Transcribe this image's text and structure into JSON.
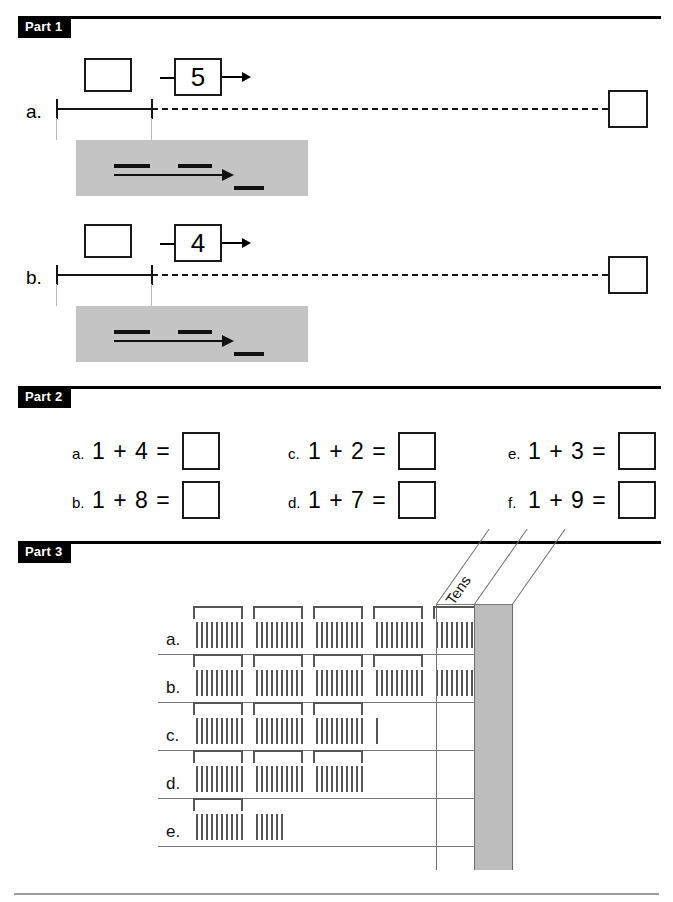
{
  "page": {
    "width": 673,
    "height": 902,
    "background": "#ffffff",
    "rule_color": "#000000",
    "gray_panel_color": "#c4c4c4",
    "tally_color": "#555555",
    "place_value_gray": "#bdbdbd"
  },
  "parts": [
    {
      "id": "part1",
      "label": "Part 1"
    },
    {
      "id": "part2",
      "label": "Part 2"
    },
    {
      "id": "part3",
      "label": "Part 3"
    }
  ],
  "part1": {
    "label": "Part 1",
    "rows": [
      {
        "label": "a.",
        "start_box_value": "",
        "operator_value": "5",
        "end_box_value": "",
        "number_line": {
          "ticks": 2,
          "solid": true,
          "dashed": true
        }
      },
      {
        "label": "b.",
        "start_box_value": "",
        "operator_value": "4",
        "end_box_value": "",
        "number_line": {
          "ticks": 2,
          "solid": true,
          "dashed": true
        }
      }
    ],
    "legend": {
      "blank_marks": 3,
      "arrow": "right-arrow"
    }
  },
  "part2": {
    "label": "Part 2",
    "problems": [
      {
        "label": "a.",
        "expression": "1 + 4 =",
        "answer": ""
      },
      {
        "label": "b.",
        "expression": "1 + 8 =",
        "answer": ""
      },
      {
        "label": "c.",
        "expression": "1 + 2 =",
        "answer": ""
      },
      {
        "label": "d.",
        "expression": "1 + 7 =",
        "answer": ""
      },
      {
        "label": "e.",
        "expression": "1 + 3 =",
        "answer": ""
      },
      {
        "label": "f.",
        "expression": "1 + 9 =",
        "answer": ""
      }
    ]
  },
  "part3": {
    "label": "Part 3",
    "column_headers": [
      "Tens",
      ""
    ],
    "rows": [
      {
        "label": "a.",
        "groups_of_ten": 5,
        "loose_tallies": 0,
        "tens_answer": "",
        "ones_answer": ""
      },
      {
        "label": "b.",
        "groups_of_ten": 4,
        "loose_tallies": 9,
        "tens_answer": "",
        "ones_answer": ""
      },
      {
        "label": "c.",
        "groups_of_ten": 3,
        "loose_tallies": 1,
        "tens_answer": "",
        "ones_answer": ""
      },
      {
        "label": "d.",
        "groups_of_ten": 3,
        "loose_tallies": 0,
        "tens_answer": "",
        "ones_answer": ""
      },
      {
        "label": "e.",
        "groups_of_ten": 1,
        "loose_tallies": 6,
        "tens_answer": "",
        "ones_answer": ""
      }
    ],
    "tallies_per_group": 10
  }
}
